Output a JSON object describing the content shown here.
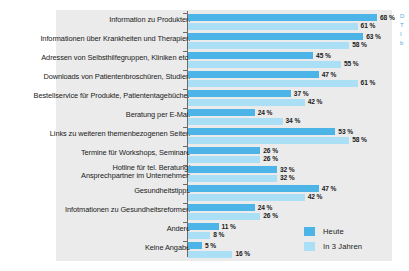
{
  "chart_data": {
    "type": "bar",
    "orientation": "horizontal",
    "title": "",
    "subtitle": "",
    "xlabel": "",
    "ylabel": "",
    "xlim": [
      0,
      75
    ],
    "grid": false,
    "legend_position": "bottom-right",
    "value_suffix": "%",
    "categories": [
      "Information zu Produkten",
      "Informationen über Krankheiten und Therapien",
      "Adressen von Selbsthilfegruppen, Kliniken etc.",
      "Downloads von Patientenbroschüren, Studien",
      "Bestellservice für Produkte, Patiententagebücher",
      "Beratung per E-Mail",
      "Links zu weiteren themenbezogenen Seiten",
      "Termine für Workshops, Seminare",
      "Hotline für tel. Beratung/\nAnsprechpartner im Unternehmen",
      "Gesundheitstipps",
      "Infotmationen zu Gesundheitsreformen",
      "Andere",
      "Keine Angabe"
    ],
    "series": [
      {
        "name": "Heute",
        "color": "#4cb4e7",
        "values": [
          68,
          63,
          45,
          47,
          37,
          24,
          53,
          26,
          32,
          47,
          24,
          11,
          5
        ],
        "labels": [
          "68 %",
          "63 %",
          "45 %",
          "47 %",
          "37 %",
          "24 %",
          "53 %",
          "26 %",
          "32 %",
          "47 %",
          "24 %",
          "11 %",
          "5 %"
        ]
      },
      {
        "name": "In 3 Jahren",
        "color": "#aadff6",
        "values": [
          61,
          58,
          55,
          61,
          42,
          34,
          58,
          26,
          32,
          42,
          26,
          8,
          16
        ],
        "labels": [
          "61 %",
          "58 %",
          "55 %",
          "61 %",
          "42 %",
          "34 %",
          "58 %",
          "26 %",
          "32 %",
          "42 %",
          "26 %",
          "8 %",
          "16 %"
        ]
      }
    ]
  },
  "legend": {
    "items": [
      {
        "label": "Heute",
        "color": "#4cb4e7"
      },
      {
        "label": "In 3 Jahren",
        "color": "#aadff6"
      }
    ]
  },
  "edge_bleed": {
    "lines": [
      "D",
      "T",
      "I",
      "b"
    ]
  },
  "colors": {
    "plot_background": "#ebebeb",
    "page_background": "#ffffff",
    "axis": "#6b6b6b",
    "text": "#1a1a1a",
    "series_today": "#4cb4e7",
    "series_future": "#aadff6"
  }
}
